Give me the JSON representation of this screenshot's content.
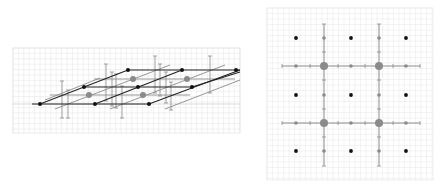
{
  "figure": {
    "left_panel": {
      "name": "oblique-lattice-view",
      "grid_color": "#e2e2e2",
      "lattice_line_color": "#222222",
      "secondary_line_color": "#8a8a8a",
      "errorbar_color": "#8a8a8a",
      "black_points": [
        [
          40,
          104
        ],
        [
          95,
          104
        ],
        [
          149,
          104
        ],
        [
          84,
          87
        ],
        [
          138,
          87
        ],
        [
          192,
          87
        ],
        [
          128,
          70
        ],
        [
          182,
          70
        ],
        [
          236,
          70
        ]
      ],
      "gray_large_points": [
        [
          89,
          95
        ],
        [
          143,
          95
        ],
        [
          133,
          79
        ],
        [
          187,
          79
        ]
      ]
    },
    "right_panel": {
      "name": "top-down-lattice-view",
      "grid_color": "#e6e6e6",
      "black_points_x": [
        296,
        351,
        406
      ],
      "black_points_y": [
        38,
        95,
        151
      ],
      "gray_large_x": [
        324,
        379
      ],
      "gray_large_y": [
        66,
        123
      ],
      "colors": {
        "black": "#111111",
        "gray": "#8a8a8a"
      }
    }
  }
}
